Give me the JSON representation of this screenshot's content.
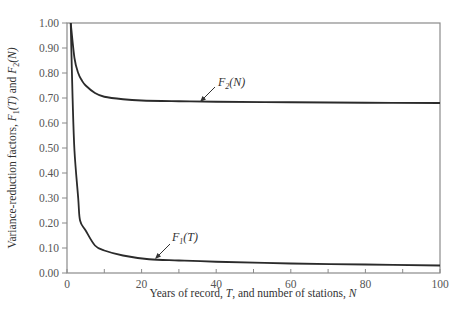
{
  "chart_data": {
    "type": "line",
    "title": "",
    "xlabel": "Years of record, T, and number of stations, N",
    "ylabel": "Variance-reduction factors, F1(T) and F2(N)",
    "xlim": [
      0,
      100
    ],
    "ylim": [
      0.0,
      1.0
    ],
    "x_ticks": [
      "0",
      "20",
      "40",
      "60",
      "80",
      "100"
    ],
    "y_ticks": [
      "0.00",
      "0.10",
      "0.20",
      "0.30",
      "0.40",
      "0.50",
      "0.60",
      "0.70",
      "0.80",
      "0.90",
      "1.00"
    ],
    "grid": false,
    "legend": "none (inline annotations)",
    "series": [
      {
        "name": "F2(N)",
        "x": [
          1,
          2,
          3,
          4,
          5,
          7.5,
          10,
          15,
          20,
          30,
          40,
          60,
          80,
          100
        ],
        "values": [
          1.0,
          0.86,
          0.8,
          0.77,
          0.75,
          0.72,
          0.705,
          0.695,
          0.69,
          0.687,
          0.685,
          0.683,
          0.681,
          0.68
        ]
      },
      {
        "name": "F1(T)",
        "x": [
          1,
          1.5,
          2,
          3,
          3.5,
          5,
          7.5,
          10,
          15,
          22,
          30,
          40,
          60,
          80,
          100
        ],
        "values": [
          1.0,
          0.7,
          0.49,
          0.3,
          0.21,
          0.17,
          0.11,
          0.09,
          0.07,
          0.055,
          0.05,
          0.045,
          0.038,
          0.034,
          0.03
        ]
      }
    ],
    "annotations": [
      {
        "text_main": "F",
        "text_sub": "2",
        "text_tail": "(N)",
        "points_to": [
          36,
          0.685
        ]
      },
      {
        "text_main": "F",
        "text_sub": "1",
        "text_tail": "(T)",
        "points_to": [
          24,
          0.055
        ]
      }
    ]
  },
  "labels": {
    "xlabel": "Years of record, T, and number of stations, N",
    "ylabel_pre": "Variance-reduction factors, ",
    "ylabel_f1": "F",
    "ylabel_f1_sub": "1",
    "ylabel_f1_tail": "(T) and ",
    "ylabel_f2": "F",
    "ylabel_f2_sub": "2",
    "ylabel_f2_tail": "(N)",
    "anno_f2_main": "F",
    "anno_f2_sub": "2",
    "anno_f2_tail": "(N)",
    "anno_f1_main": "F",
    "anno_f1_sub": "1",
    "anno_f1_tail": "(T)"
  },
  "style": {
    "line_color": "#2b2b2b",
    "axis_color": "#777777",
    "tick_label_color": "#555555"
  }
}
